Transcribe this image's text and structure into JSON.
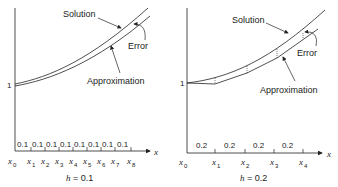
{
  "panels": [
    {
      "id": "left",
      "caption": "h = 0.1",
      "caption_var": "h",
      "caption_val": "= 0.1",
      "y_tick": "1",
      "x_axis_label": "x",
      "step_label": "0.1",
      "step_count": 8,
      "x_labels": [
        "x0",
        "x1",
        "x2",
        "x3",
        "x4",
        "x5",
        "x6",
        "x7",
        "x8"
      ],
      "annotations": {
        "solution": "Solution",
        "error": "Error",
        "approximation": "Approximation"
      }
    },
    {
      "id": "right",
      "caption": "h = 0.2",
      "caption_var": "h",
      "caption_val": "= 0.2",
      "y_tick": "1",
      "x_axis_label": "x",
      "step_label": "0.2",
      "step_count": 4,
      "x_labels": [
        "x0",
        "x1",
        "x2",
        "x3",
        "x4"
      ],
      "annotations": {
        "solution": "Solution",
        "error": "Error",
        "approximation": "Approximation"
      }
    }
  ],
  "text": {
    "left_solution": "Solution",
    "left_error": "Error",
    "left_approx": "Approximation",
    "left_y1": "1",
    "left_x": "x",
    "left_h": "h",
    "left_hval": " = 0.1",
    "left_step": "0.1",
    "right_solution": "Solution",
    "right_error": "Error",
    "right_approx": "Approximation",
    "right_y1": "1",
    "right_x": "x",
    "right_h": "h",
    "right_hval": " = 0.2",
    "right_step": "0.2",
    "x": "x"
  }
}
